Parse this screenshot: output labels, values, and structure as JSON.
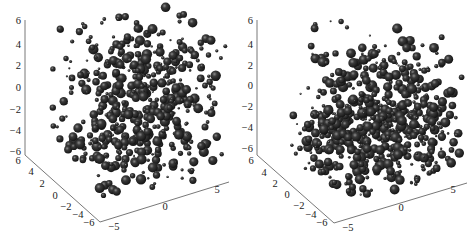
{
  "chart_data": [
    {
      "type": "scatter",
      "subtype": "3d-bubble",
      "title": "",
      "xlabel": "",
      "ylabel": "",
      "zlabel": "",
      "x_ticks": [
        "-5",
        "0",
        "5"
      ],
      "y_ticks": [
        "6",
        "4",
        "2",
        "0",
        "-2",
        "-4",
        "-6"
      ],
      "z_ticks": [
        "6",
        "4",
        "2",
        "0",
        "-2",
        "-4",
        "-6"
      ],
      "xlim": [
        -6,
        6
      ],
      "ylim": [
        -6,
        6
      ],
      "zlim": [
        -6,
        6
      ],
      "grid": false,
      "marker_color": "#2a2a2a",
      "description": "Roughly uniform spherical cloud of spheres of varying radius filling the cube",
      "distribution": "uniform",
      "seed": 7,
      "n_points": 520
    },
    {
      "type": "scatter",
      "subtype": "3d-bubble",
      "title": "",
      "xlabel": "",
      "ylabel": "",
      "zlabel": "",
      "x_ticks": [
        "-5",
        "0",
        "5"
      ],
      "y_ticks": [
        "6",
        "4",
        "2",
        "0",
        "-2",
        "-4",
        "-6"
      ],
      "z_ticks": [
        "6",
        "4",
        "2",
        "0",
        "-2",
        "-4",
        "-6"
      ],
      "xlim": [
        -6,
        6
      ],
      "ylim": [
        -6,
        6
      ],
      "zlim": [
        -6,
        6
      ],
      "grid": false,
      "marker_color": "#2a2a2a",
      "description": "Spheres concentrated densely in the lower half (z < 0) with a sparser arc of spheres in the upper half",
      "distribution": "bottom-heavy",
      "seed": 13,
      "n_points": 640
    }
  ],
  "panels": [
    {
      "z_tick_labels": [
        "6",
        "4",
        "2",
        "0",
        "-2",
        "-4",
        "-6"
      ],
      "y_tick_labels": [
        "6",
        "4",
        "2",
        "0",
        "-2",
        "-4",
        "-6"
      ],
      "x_tick_labels": [
        "-5",
        "0",
        "5"
      ]
    },
    {
      "z_tick_labels": [
        "6",
        "4",
        "2",
        "0",
        "-2",
        "-4",
        "-6"
      ],
      "y_tick_labels": [
        "6",
        "4",
        "2",
        "0",
        "-2",
        "-4",
        "-6"
      ],
      "x_tick_labels": [
        "-5",
        "0",
        "5"
      ]
    }
  ]
}
